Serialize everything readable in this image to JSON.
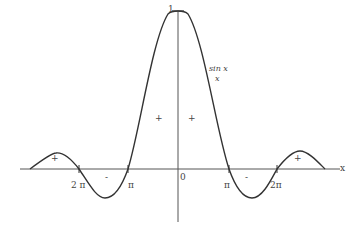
{
  "diagram": {
    "function_label": {
      "numerator": "sin x",
      "denominator": "x"
    },
    "peak_label": "1",
    "origin_label": "0",
    "axis_x_label": "x",
    "tick_labels": {
      "neg_2pi": "2 π",
      "neg_pi": "π",
      "pos_pi": "π",
      "pos_2pi": "2π"
    },
    "sign_labels": {
      "left_outer": "+",
      "left_mid": "-",
      "center_left": "+",
      "center_right": "+",
      "right_mid": "-",
      "right_outer": "+"
    },
    "colors": {
      "curve": "#333333",
      "axis": "#555555",
      "background": "#ffffff"
    }
  }
}
